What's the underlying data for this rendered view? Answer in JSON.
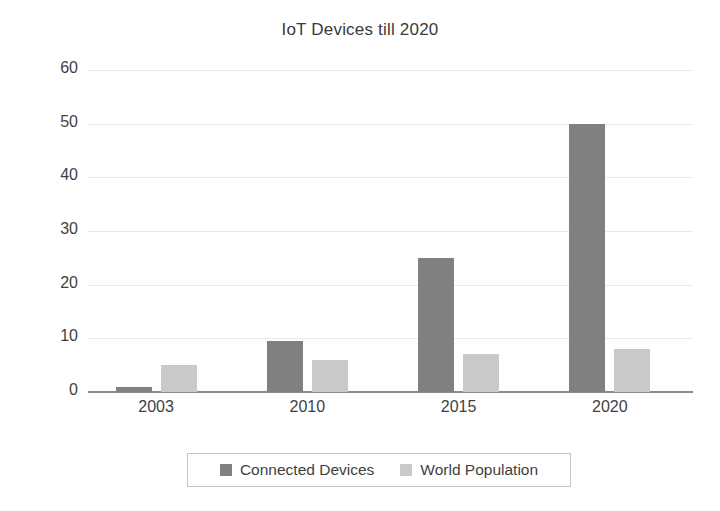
{
  "chart_data": {
    "type": "bar",
    "title": "IoT Devices till 2020",
    "xlabel": "",
    "ylabel": "",
    "categories": [
      "2003",
      "2010",
      "2015",
      "2020"
    ],
    "series": [
      {
        "name": "Connected Devices",
        "color": "#808080",
        "values": [
          1,
          9.5,
          25,
          50
        ]
      },
      {
        "name": "World Population",
        "color": "#c9c9c9",
        "values": [
          5,
          6,
          7,
          8
        ]
      }
    ],
    "ylim": [
      0,
      60
    ],
    "ytick_labels": [
      "0",
      "10",
      "20",
      "30",
      "40",
      "50",
      "60"
    ],
    "ytick_values": [
      0,
      10,
      20,
      30,
      40,
      50,
      60
    ],
    "grid": true,
    "grid_axis": "y",
    "legend_position": "bottom",
    "legend_border_color": "#c4c4c4",
    "background_color": "#ffffff",
    "text_color": "#3f3f3f",
    "axis_line_color": "#8c8c8c",
    "gridline_color": "#e9e9e9"
  }
}
